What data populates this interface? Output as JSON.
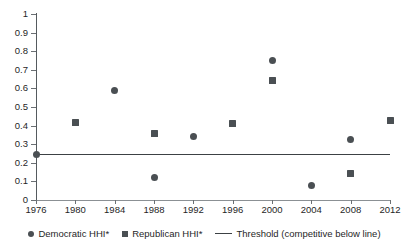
{
  "chart_data": {
    "type": "scatter",
    "title": "",
    "xlabel": "",
    "ylabel": "",
    "x": [
      1976,
      1980,
      1984,
      1988,
      1992,
      1996,
      2000,
      2004,
      2008,
      2012
    ],
    "categories": [
      "1976",
      "1980",
      "1984",
      "1988",
      "1992",
      "1996",
      "2000",
      "2004",
      "2008",
      "2012"
    ],
    "xlim": [
      1976,
      2012
    ],
    "ylim": [
      0,
      1
    ],
    "ytick_labels": [
      "1",
      "0.9",
      "0.8",
      "0.7",
      "0.6",
      "0.5",
      "0.4",
      "0.3",
      "0.2",
      "0.1",
      "0"
    ],
    "ytick_values": [
      1,
      0.9,
      0.8,
      0.7,
      0.6,
      0.5,
      0.4,
      0.3,
      0.2,
      0.1,
      0
    ],
    "grid": false,
    "legend_position": "bottom",
    "series": [
      {
        "name": "Democratic HHI*",
        "marker": "circle",
        "color": "#4a4f53",
        "points": [
          {
            "x": 1976,
            "y": 0.245
          },
          {
            "x": 1984,
            "y": 0.59
          },
          {
            "x": 1988,
            "y": 0.12
          },
          {
            "x": 1992,
            "y": 0.34
          },
          {
            "x": 2000,
            "y": 0.75
          },
          {
            "x": 2004,
            "y": 0.08
          },
          {
            "x": 2008,
            "y": 0.325
          }
        ]
      },
      {
        "name": "Republican HHI*",
        "marker": "square",
        "color": "#4a4f53",
        "points": [
          {
            "x": 1980,
            "y": 0.415
          },
          {
            "x": 1988,
            "y": 0.355
          },
          {
            "x": 1996,
            "y": 0.41
          },
          {
            "x": 2000,
            "y": 0.645
          },
          {
            "x": 2008,
            "y": 0.145
          },
          {
            "x": 2012,
            "y": 0.425
          }
        ]
      }
    ],
    "threshold": {
      "name": "Threshold (competitive below line)",
      "value": 0.245,
      "color": "#3c4144",
      "x_start": 1976,
      "x_end": 2012
    }
  },
  "legend": {
    "items": [
      {
        "label": "Democratic HHI*",
        "marker": "circle"
      },
      {
        "label": "Republican HHI*",
        "marker": "square"
      },
      {
        "label": "Threshold (competitive below line)",
        "marker": "line"
      }
    ]
  }
}
